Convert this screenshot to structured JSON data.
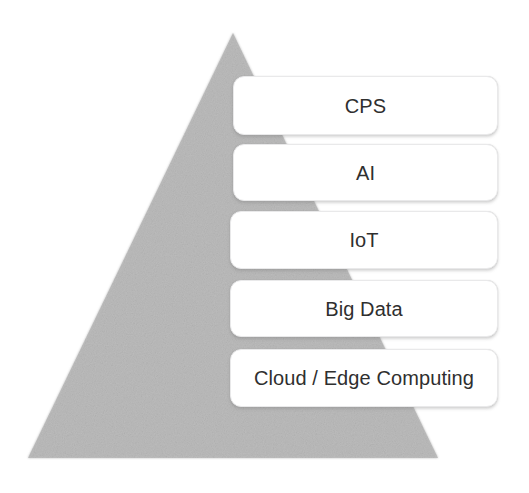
{
  "diagram": {
    "type": "layered-pyramid",
    "title": "",
    "background_color": "#ffffff",
    "pyramid": {
      "name": "technology-pyramid",
      "fill_color": "#b8b8b8",
      "texture": "noisy-grain",
      "apex": {
        "x": 233,
        "y": 33
      },
      "base_left": {
        "x": 28,
        "y": 458
      },
      "base_right": {
        "x": 438,
        "y": 458
      }
    },
    "layers": [
      {
        "id": "layer-cps",
        "label": "CPS",
        "level": 5,
        "box_color": "#ffffff",
        "text_color": "#2f2f2f"
      },
      {
        "id": "layer-ai",
        "label": "AI",
        "level": 4,
        "box_color": "#ffffff",
        "text_color": "#2f2f2f"
      },
      {
        "id": "layer-iot",
        "label": "IoT",
        "level": 3,
        "box_color": "#ffffff",
        "text_color": "#2f2f2f"
      },
      {
        "id": "layer-big-data",
        "label": "Big Data",
        "level": 2,
        "box_color": "#ffffff",
        "text_color": "#2f2f2f"
      },
      {
        "id": "layer-cloud-edge",
        "label": "Cloud / Edge Computing",
        "level": 1,
        "box_color": "#ffffff",
        "text_color": "#2f2f2f"
      }
    ]
  }
}
